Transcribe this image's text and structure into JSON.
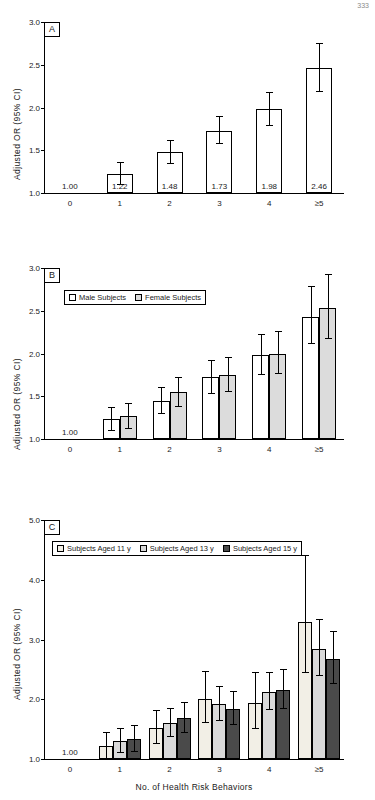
{
  "figure": {
    "corner_note": "333",
    "ylabel": "Adjusted OR (95% CI)",
    "xlabel": "No. of Health Risk Behaviors"
  },
  "chart_data": [
    {
      "type": "bar",
      "panel": "A",
      "title": "",
      "xlabel": "",
      "ylabel": "Adjusted OR (95% CI)",
      "categories": [
        "0",
        "1",
        "2",
        "3",
        "4",
        "≥5"
      ],
      "ylim": [
        1.0,
        3.0
      ],
      "yticks": [
        1.0,
        1.5,
        2.0,
        2.5,
        3.0
      ],
      "ytick_labels": [
        "1.0",
        "1.5",
        "2.0",
        "2.5",
        "3.0"
      ],
      "grid": false,
      "legend": null,
      "series": [
        {
          "name": "All Subjects",
          "color": "#ffffff",
          "values": [
            1.0,
            1.22,
            1.48,
            1.73,
            1.98,
            2.46
          ],
          "data_labels": [
            "1.00",
            "1.22",
            "1.48",
            "1.73",
            "1.98",
            "2.46"
          ],
          "ci_low": [
            null,
            1.1,
            1.35,
            1.58,
            1.8,
            2.19
          ],
          "ci_high": [
            null,
            1.36,
            1.62,
            1.9,
            2.18,
            2.76
          ]
        }
      ]
    },
    {
      "type": "bar",
      "panel": "B",
      "title": "",
      "xlabel": "",
      "ylabel": "Adjusted OR (95% CI)",
      "categories": [
        "0",
        "1",
        "2",
        "3",
        "4",
        "≥5"
      ],
      "ylim": [
        1.0,
        3.0
      ],
      "yticks": [
        1.0,
        1.5,
        2.0,
        2.5,
        3.0
      ],
      "ytick_labels": [
        "1.0",
        "1.5",
        "2.0",
        "2.5",
        "3.0"
      ],
      "grid": false,
      "legend": {
        "position": "top-left",
        "entries": [
          "Male Subjects",
          "Female Subjects"
        ]
      },
      "reference_label": "1.00",
      "series": [
        {
          "name": "Male Subjects",
          "color": "#ffffff",
          "values": [
            1.0,
            1.23,
            1.45,
            1.72,
            1.98,
            2.43
          ],
          "ci_low": [
            null,
            1.1,
            1.3,
            1.54,
            1.76,
            2.12
          ],
          "ci_high": [
            null,
            1.37,
            1.61,
            1.92,
            2.23,
            2.79
          ]
        },
        {
          "name": "Female Subjects",
          "color": "#dcdcdc",
          "values": [
            1.0,
            1.27,
            1.55,
            1.75,
            2.0,
            2.53
          ],
          "ci_low": [
            null,
            1.13,
            1.39,
            1.56,
            1.77,
            2.18
          ],
          "ci_high": [
            null,
            1.42,
            1.72,
            1.96,
            2.26,
            2.93
          ]
        }
      ]
    },
    {
      "type": "bar",
      "panel": "C",
      "title": "",
      "xlabel": "No. of Health Risk Behaviors",
      "ylabel": "Adjusted OR (95% CI)",
      "categories": [
        "0",
        "1",
        "2",
        "3",
        "4",
        "≥5"
      ],
      "ylim": [
        1.0,
        5.0
      ],
      "yticks": [
        1.0,
        2.0,
        3.0,
        4.0,
        5.0
      ],
      "ytick_labels": [
        "1.0",
        "2.0",
        "3.0",
        "4.0",
        "5.0"
      ],
      "grid": false,
      "legend": {
        "position": "top-left",
        "entries": [
          "Subjects Aged 11 y",
          "Subjects Aged 13 y",
          "Subjects Aged 15 y"
        ]
      },
      "reference_label": "1.00",
      "series": [
        {
          "name": "Subjects Aged 11 y",
          "color": "#f2efe6",
          "values": [
            1.0,
            1.22,
            1.52,
            2.0,
            1.93,
            3.3
          ],
          "ci_low": [
            null,
            1.02,
            1.27,
            1.62,
            1.52,
            2.46
          ],
          "ci_high": [
            null,
            1.46,
            1.82,
            2.47,
            2.45,
            4.42
          ]
        },
        {
          "name": "Subjects Aged 13 y",
          "color": "#d9d9d9",
          "values": [
            1.0,
            1.3,
            1.6,
            1.92,
            2.12,
            2.84
          ],
          "ci_low": [
            null,
            1.11,
            1.38,
            1.66,
            1.83,
            2.41
          ],
          "ci_high": [
            null,
            1.52,
            1.86,
            2.22,
            2.46,
            3.35
          ]
        },
        {
          "name": "Subjects Aged 15 y",
          "color": "#4a4a4a",
          "values": [
            1.0,
            1.34,
            1.68,
            1.84,
            2.16,
            2.67
          ],
          "ci_low": [
            null,
            1.14,
            1.45,
            1.59,
            1.86,
            2.27
          ],
          "ci_high": [
            null,
            1.57,
            1.95,
            2.13,
            2.51,
            3.14
          ]
        }
      ]
    }
  ]
}
